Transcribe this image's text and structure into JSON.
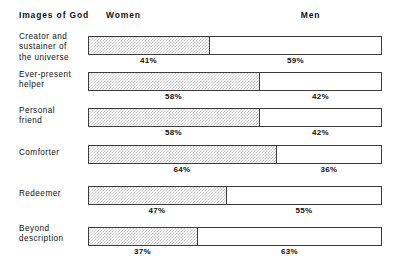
{
  "chart_data": {
    "type": "bar",
    "subtype": "stacked-horizontal-100",
    "title": "",
    "xlabel": "",
    "ylabel": "",
    "grid": false,
    "legend_position": "top",
    "xlim": [
      0,
      100
    ],
    "row_header": "Images of God",
    "categories": [
      "Creator and\nsustainer of\nthe universe",
      "Ever-present\nhelper",
      "Personal\nfriend",
      "Comforter",
      "Redeemer",
      "Beyond\ndescription"
    ],
    "series": [
      {
        "name": "Women",
        "values": [
          41,
          58,
          58,
          64,
          47,
          37
        ]
      },
      {
        "name": "Men",
        "values": [
          59,
          42,
          42,
          36,
          55,
          63
        ]
      }
    ],
    "value_labels": [
      {
        "women": "41%",
        "men": "59%"
      },
      {
        "women": "58%",
        "men": "42%"
      },
      {
        "women": "58%",
        "men": "42%"
      },
      {
        "women": "64%",
        "men": "36%"
      },
      {
        "women": "47%",
        "men": "55%"
      },
      {
        "women": "37%",
        "men": "63%"
      }
    ],
    "colors": {
      "women_fill": "#c9c9c9",
      "men_fill": "#ffffff",
      "border": "#3c3c3c",
      "text": "#111111",
      "background": "#ffffff"
    }
  },
  "header": {
    "title": "Images of God",
    "women_label": "Women",
    "men_label": "Men"
  },
  "rows": [
    {
      "label": "Creator and\nsustainer of\nthe universe",
      "women_pct": 41,
      "men_pct": 59,
      "women_text": "41%",
      "men_text": "59%"
    },
    {
      "label": "Ever-present\nhelper",
      "women_pct": 58,
      "men_pct": 42,
      "women_text": "58%",
      "men_text": "42%"
    },
    {
      "label": "Personal\nfriend",
      "women_pct": 58,
      "men_pct": 42,
      "women_text": "58%",
      "men_text": "42%"
    },
    {
      "label": "Comforter",
      "women_pct": 64,
      "men_pct": 36,
      "women_text": "64%",
      "men_text": "36%"
    },
    {
      "label": "Redeemer",
      "women_pct": 47,
      "men_pct": 53,
      "women_text": "47%",
      "men_text": "55%"
    },
    {
      "label": "Beyond\ndescription",
      "women_pct": 37,
      "men_pct": 63,
      "women_text": "37%",
      "men_text": "63%"
    }
  ]
}
